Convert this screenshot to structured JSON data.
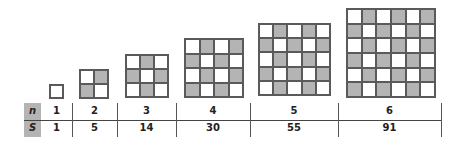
{
  "table": {
    "row_labels": {
      "n": "n",
      "s": "S"
    },
    "n_values": [
      "1",
      "2",
      "3",
      "4",
      "5",
      "6"
    ],
    "s_values": [
      "1",
      "5",
      "14",
      "30",
      "55",
      "91"
    ]
  },
  "figures": [
    {
      "n": 1,
      "left": 49,
      "top": 84,
      "size": 15
    },
    {
      "n": 2,
      "left": 79,
      "top": 69,
      "size": 30
    },
    {
      "n": 3,
      "left": 125,
      "top": 54,
      "size": 44
    },
    {
      "n": 4,
      "left": 184,
      "top": 38,
      "size": 60
    },
    {
      "n": 5,
      "left": 258,
      "top": 23,
      "size": 73
    },
    {
      "n": 6,
      "left": 346,
      "top": 8,
      "size": 90
    }
  ],
  "columns": [
    {
      "left": 41,
      "right": 72
    },
    {
      "left": 72,
      "right": 117
    },
    {
      "left": 117,
      "right": 176
    },
    {
      "left": 176,
      "right": 250
    },
    {
      "left": 250,
      "right": 338
    },
    {
      "left": 338,
      "right": 441
    }
  ],
  "colors": {
    "shaded": "#b4b4b4",
    "unshaded": "#ffffff",
    "line": "#5a5a5a"
  }
}
